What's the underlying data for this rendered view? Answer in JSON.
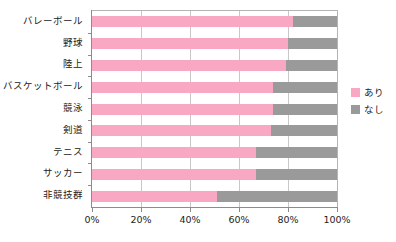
{
  "chart_data": {
    "type": "bar",
    "orientation": "horizontal",
    "stacked": true,
    "normalized_percent": true,
    "title": "",
    "xlabel": "",
    "ylabel": "",
    "xlim": [
      0,
      100
    ],
    "xticks": [
      0,
      20,
      40,
      60,
      80,
      100
    ],
    "xtick_labels": [
      "0%",
      "20%",
      "40%",
      "60%",
      "80%",
      "100%"
    ],
    "grid": "vertical",
    "legend_position": "right",
    "categories": [
      "バレーボール",
      "野球",
      "陸上",
      "バスケットボール",
      "競泳",
      "剣道",
      "テニス",
      "サッカー",
      "非競技群"
    ],
    "series": [
      {
        "name": "あり",
        "color": "#F9A8C4",
        "values": [
          82,
          80,
          79,
          74,
          74,
          73,
          67,
          67,
          51
        ]
      },
      {
        "name": "なし",
        "color": "#9A9A9A",
        "values": [
          18,
          20,
          21,
          26,
          26,
          27,
          33,
          33,
          49
        ]
      }
    ]
  },
  "legend": {
    "items": [
      {
        "label": "あり",
        "color": "#F9A8C4"
      },
      {
        "label": "なし",
        "color": "#9A9A9A"
      }
    ]
  }
}
